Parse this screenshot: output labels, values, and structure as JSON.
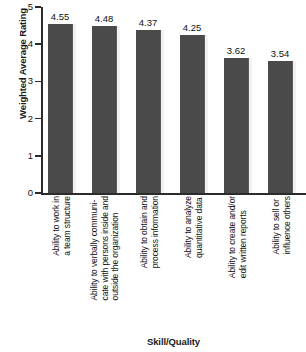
{
  "chart_data": {
    "type": "bar",
    "title": "",
    "xlabel": "Skill/Quality",
    "ylabel": "Weighted Average Rating",
    "ylim": [
      0,
      5
    ],
    "yticks": [
      "0",
      "1",
      "2",
      "3",
      "4",
      "5"
    ],
    "grid": false,
    "legend": "none",
    "orientation": "vertical",
    "bar_color": "#4a4a4a",
    "background_color": "#ffffff",
    "category_label_rotation": -90,
    "categories": [
      "Ability to work in a team structure",
      "Ability to verbally communicate with persons inside and outside the organization",
      "Ability to obtain and process information",
      "Ability to analyze quantitative data",
      "Ability to create and/or edit written reports",
      "Ability to sell or influence others"
    ],
    "category_label_lines": [
      [
        "Ability to work in",
        "a team structure"
      ],
      [
        "Ability to verbally communi-",
        "cate with persons inside and",
        "outside the organization"
      ],
      [
        "Ability to obtain and",
        "process information"
      ],
      [
        "Ability to analyze",
        "quantitative data"
      ],
      [
        "Ability to create and/or",
        "edit written reports"
      ],
      [
        "Ability to sell or",
        "influence others"
      ]
    ],
    "values": [
      4.55,
      4.48,
      4.37,
      4.25,
      3.62,
      3.54
    ],
    "value_labels": [
      "4.55",
      "4.48",
      "4.37",
      "4.25",
      "3.62",
      "3.54"
    ]
  }
}
